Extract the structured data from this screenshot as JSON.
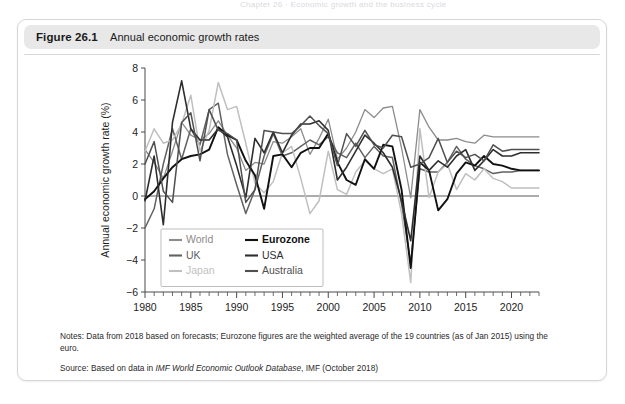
{
  "page": {
    "running_header": "Chapter 26 · Economic growth and the business cycle"
  },
  "figure": {
    "number_label": "Figure 26.1",
    "title": "Annual economic growth rates",
    "notes_label": "Notes:",
    "notes_text": "Data from 2018 based on forecasts; Eurozone figures are the weighted average of the 19 countries (as of Jan 2015) using the euro.",
    "source_label": "Source:",
    "source_prefix": "Based on data in ",
    "source_italic": "IMF World Economic Outlook Database",
    "source_suffix": ", IMF (October 2018)"
  },
  "chart_data": {
    "type": "line",
    "title": "Annual economic growth rates",
    "xlabel": "",
    "ylabel": "Annual economic growth rate (%)",
    "xlim": [
      1980,
      2023
    ],
    "ylim": [
      -6,
      8
    ],
    "ytick_step": 2,
    "yticks": [
      -6,
      -4,
      -2,
      0,
      2,
      4,
      6,
      8
    ],
    "xticks_major": [
      1980,
      1985,
      1990,
      1995,
      2000,
      2005,
      2010,
      2015,
      2020
    ],
    "xtick_minor_step": 1,
    "grid": false,
    "zero_line": true,
    "legend_position": "lower-left-inside",
    "legend_columns": 2,
    "x": [
      1980,
      1981,
      1982,
      1983,
      1984,
      1985,
      1986,
      1987,
      1988,
      1989,
      1990,
      1991,
      1992,
      1993,
      1994,
      1995,
      1996,
      1997,
      1998,
      1999,
      2000,
      2001,
      2002,
      2003,
      2004,
      2005,
      2006,
      2007,
      2008,
      2009,
      2010,
      2011,
      2012,
      2013,
      2014,
      2015,
      2016,
      2017,
      2018,
      2019,
      2020,
      2021,
      2022,
      2023
    ],
    "series": [
      {
        "name": "World",
        "color": "#8c8c8c",
        "width": 1.3,
        "values": [
          2.9,
          2.1,
          1.1,
          2.8,
          4.6,
          3.8,
          3.5,
          3.9,
          4.7,
          3.8,
          3.0,
          1.6,
          2.1,
          2.0,
          3.4,
          3.3,
          3.7,
          4.2,
          2.6,
          3.6,
          4.8,
          2.3,
          3.0,
          4.0,
          5.4,
          4.9,
          5.5,
          5.6,
          3.0,
          -0.1,
          5.4,
          4.3,
          3.5,
          3.5,
          3.6,
          3.4,
          3.3,
          3.8,
          3.7,
          3.7,
          3.7,
          3.7,
          3.7,
          3.7
        ]
      },
      {
        "name": "UK",
        "color": "#616161",
        "width": 1.5,
        "values": [
          -2.0,
          -0.8,
          2.0,
          4.2,
          2.3,
          4.2,
          3.2,
          5.4,
          5.8,
          2.6,
          0.7,
          -1.1,
          0.4,
          2.5,
          3.9,
          2.5,
          2.7,
          3.1,
          3.5,
          3.2,
          3.7,
          2.7,
          2.4,
          3.3,
          2.4,
          3.1,
          2.5,
          2.4,
          -0.5,
          -4.2,
          1.7,
          1.5,
          1.5,
          2.1,
          3.1,
          2.3,
          1.9,
          1.7,
          1.4,
          1.5,
          1.5,
          1.6,
          1.6,
          1.6
        ]
      },
      {
        "name": "Japan",
        "color": "#bfbfbf",
        "width": 1.5,
        "values": [
          2.8,
          4.2,
          3.3,
          3.5,
          4.5,
          6.3,
          2.8,
          4.1,
          7.1,
          5.4,
          5.6,
          3.3,
          0.8,
          0.2,
          0.9,
          2.7,
          3.1,
          1.1,
          -1.1,
          -0.3,
          2.8,
          0.4,
          0.1,
          1.5,
          2.2,
          1.7,
          1.4,
          1.7,
          -1.1,
          -5.4,
          4.2,
          -0.1,
          1.5,
          2.0,
          0.4,
          1.4,
          1.0,
          1.7,
          1.1,
          0.9,
          0.5,
          0.5,
          0.5,
          0.5
        ]
      },
      {
        "name": "Eurozone",
        "color": "#111111",
        "width": 1.9,
        "values": [
          -0.2,
          0.3,
          1.1,
          1.8,
          2.3,
          2.5,
          2.6,
          2.9,
          4.3,
          3.8,
          3.5,
          2.2,
          1.3,
          -0.8,
          2.5,
          2.6,
          1.8,
          2.7,
          3.0,
          3.0,
          3.9,
          2.1,
          1.0,
          0.7,
          2.3,
          1.7,
          3.2,
          3.1,
          0.4,
          -4.5,
          2.1,
          1.6,
          -0.9,
          -0.2,
          1.4,
          2.1,
          1.9,
          2.5,
          2.0,
          1.9,
          1.7,
          1.6,
          1.6,
          1.6
        ]
      },
      {
        "name": "USA",
        "color": "#2e2e2e",
        "width": 1.6,
        "values": [
          -0.3,
          2.5,
          -1.8,
          4.6,
          7.2,
          4.2,
          3.5,
          3.5,
          4.2,
          3.7,
          1.9,
          -0.1,
          3.6,
          2.7,
          4.0,
          2.7,
          3.8,
          4.5,
          4.5,
          4.7,
          4.1,
          1.0,
          1.8,
          2.8,
          3.8,
          3.3,
          2.7,
          1.8,
          -0.3,
          -2.8,
          2.5,
          1.6,
          2.2,
          1.8,
          2.5,
          2.9,
          1.6,
          2.2,
          2.9,
          2.5,
          2.5,
          2.7,
          2.7,
          2.7
        ]
      },
      {
        "name": "Australia",
        "color": "#4f4f4f",
        "width": 1.5,
        "values": [
          2.0,
          3.4,
          0.3,
          -0.4,
          4.6,
          5.2,
          2.2,
          5.4,
          4.1,
          3.9,
          3.5,
          -0.4,
          0.4,
          4.1,
          4.0,
          3.9,
          3.9,
          4.4,
          5.0,
          4.4,
          3.9,
          1.9,
          3.9,
          3.1,
          4.1,
          3.2,
          3.0,
          3.8,
          3.7,
          1.8,
          2.0,
          2.4,
          3.6,
          2.1,
          2.8,
          2.4,
          2.6,
          2.2,
          3.2,
          2.8,
          2.9,
          2.9,
          2.9,
          2.9
        ]
      }
    ],
    "legend_layout": [
      [
        "World",
        "Eurozone"
      ],
      [
        "UK",
        "USA"
      ],
      [
        "Japan",
        "Australia"
      ]
    ]
  }
}
